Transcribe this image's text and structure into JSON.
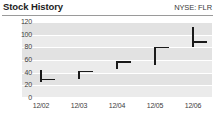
{
  "header": {
    "title": "Stock History",
    "ticker": "NYSE: FLR"
  },
  "chart_data": {
    "type": "ohlc",
    "title": "Stock History",
    "subtitle": "NYSE: FLR",
    "xlabel": "",
    "ylabel": "",
    "categories": [
      "12/02",
      "12/03",
      "12/04",
      "12/05",
      "12/06"
    ],
    "ylim": [
      0,
      120
    ],
    "yticks": [
      0,
      20,
      40,
      60,
      80,
      100,
      120
    ],
    "ytick_labels": [
      "0",
      "20",
      "40",
      "60",
      "80",
      "100",
      "120"
    ],
    "grid": true,
    "legend": "none",
    "series": [
      {
        "name": "High-Low-Close",
        "points": [
          {
            "x": "12/02",
            "high": 45,
            "low": 25,
            "close": 29
          },
          {
            "x": "12/03",
            "high": 42,
            "low": 30,
            "close": 42
          },
          {
            "x": "12/04",
            "high": 57,
            "low": 45,
            "close": 57
          },
          {
            "x": "12/05",
            "high": 80,
            "low": 52,
            "close": 80
          },
          {
            "x": "12/06",
            "high": 112,
            "low": 80,
            "close": 88
          }
        ]
      }
    ],
    "colors": {
      "bar": "#1a1a1a",
      "plot_background": "#e2e2e2",
      "band": "#ebebeb",
      "gridline": "#ffffff",
      "text": "#3d3d3d",
      "title": "#1d1d1d",
      "rule": "#9a9a9a"
    }
  }
}
